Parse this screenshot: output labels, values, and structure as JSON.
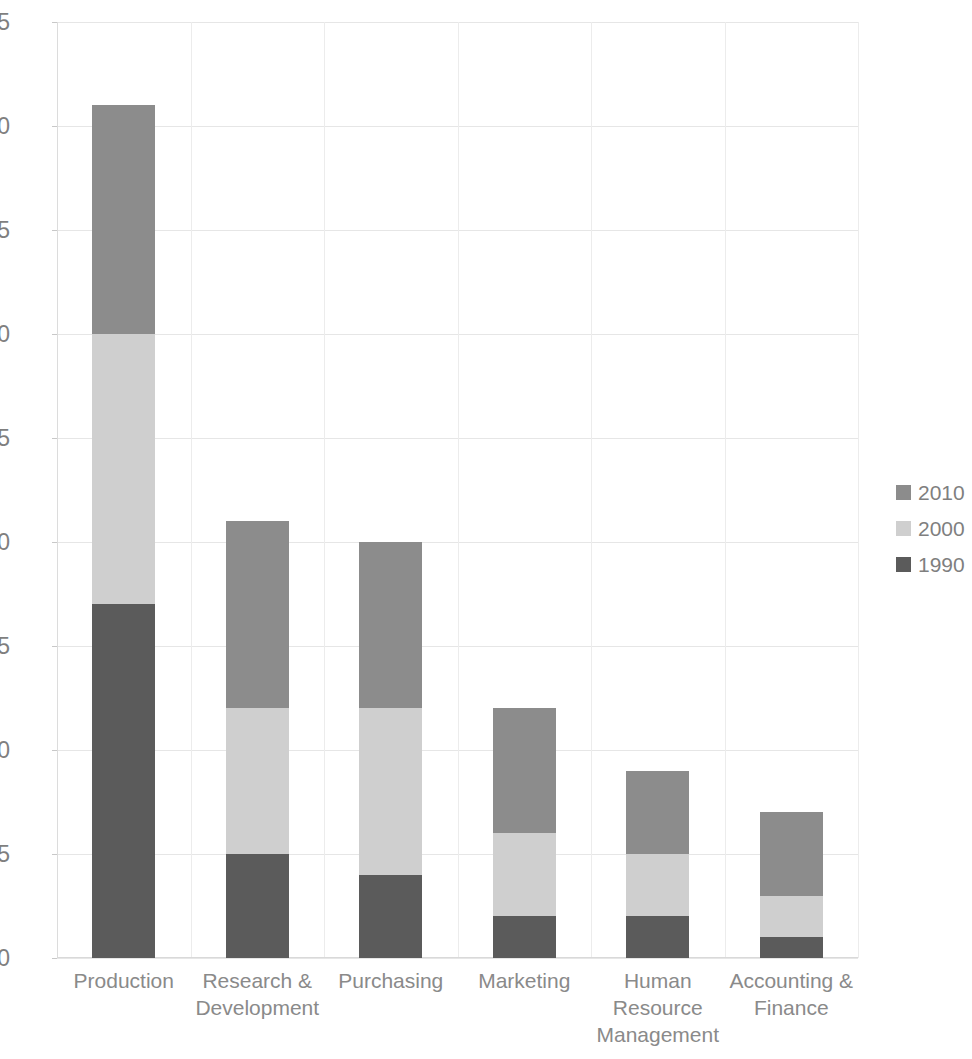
{
  "chart_data": {
    "type": "bar",
    "subtype": "stacked-bar",
    "title": "",
    "subtitle": "",
    "xlabel": "",
    "ylabel": "",
    "categories": [
      "Production",
      "Research &\nDevelopment",
      "Purchasing",
      "Marketing",
      "Human\nResource\nManagement",
      "Accounting &\nFinance"
    ],
    "series": [
      {
        "name": "1990",
        "color": "#5b5b5b",
        "values": [
          17,
          5,
          4,
          2,
          2,
          1
        ]
      },
      {
        "name": "2000",
        "color": "#cfcfcf",
        "values": [
          13,
          7,
          8,
          4,
          3,
          2
        ]
      },
      {
        "name": "2010",
        "color": "#8c8c8c",
        "values": [
          11,
          9,
          8,
          6,
          4,
          4
        ]
      }
    ],
    "stack_order_bottom_to_top": [
      "1990",
      "2000",
      "2010"
    ],
    "totals": [
      41,
      21,
      20,
      12,
      9,
      7
    ],
    "ylim": [
      0,
      45
    ],
    "ytick_values": [
      0,
      5,
      10,
      15,
      20,
      25,
      30,
      35,
      40,
      45
    ],
    "ytick_labels": [
      "0",
      "5",
      "10",
      "15",
      "20",
      "25",
      "30",
      "35",
      "40",
      "45"
    ],
    "ytick_interval": 5,
    "grid": {
      "horizontal": true,
      "vertical": true
    },
    "legend": {
      "position": "right",
      "entries": [
        {
          "label": "2010",
          "color": "#8c8c8c"
        },
        {
          "label": "2000",
          "color": "#cfcfcf"
        },
        {
          "label": "1990",
          "color": "#5b5b5b"
        }
      ]
    },
    "background_color": "#ffffff",
    "gridline_color": "#e6e6e6",
    "tick_label_color": "#7f7f7f",
    "category_label_color": "#8a8a8a"
  }
}
